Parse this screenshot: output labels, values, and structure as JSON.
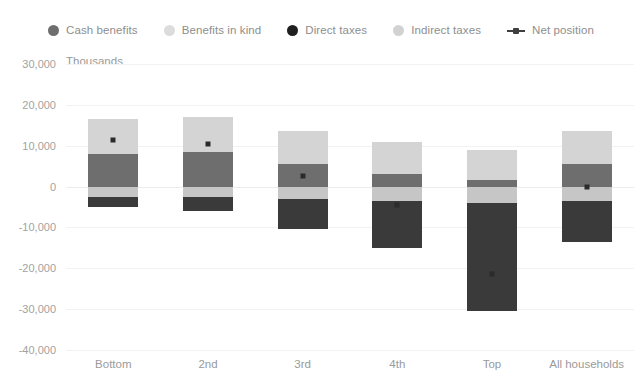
{
  "chart_data": {
    "type": "bar",
    "subtype": "stacked-bar-with-line",
    "title": "",
    "xlabel": "",
    "ylabel": "Thousands",
    "ylim": [
      -40000,
      30000
    ],
    "ytick_step": 10000,
    "grid": true,
    "legend_position": "top",
    "categories": [
      "Bottom",
      "2nd",
      "3rd",
      "4th",
      "Top",
      "All households"
    ],
    "ytick_labels": [
      "30,000",
      "20,000",
      "10,000",
      "0",
      "-10,000",
      "-20,000",
      "-30,000",
      "-40,000"
    ],
    "ytick_values": [
      30000,
      20000,
      10000,
      0,
      -10000,
      -20000,
      -30000,
      -40000
    ],
    "series": [
      {
        "name": "Cash benefits",
        "color": "#6e6e6e",
        "type": "bar",
        "values": [
          8000,
          8500,
          5500,
          3000,
          1500,
          5500
        ]
      },
      {
        "name": "Benefits in kind",
        "color": "#d4d4d4",
        "type": "bar",
        "values": [
          8500,
          8500,
          8000,
          8000,
          7500,
          8000
        ]
      },
      {
        "name": "Indirect taxes",
        "color": "#c6c6c6",
        "type": "bar",
        "values": [
          -2500,
          -2500,
          -3000,
          -3500,
          -4000,
          -3500
        ]
      },
      {
        "name": "Direct taxes",
        "color": "#3a3a3a",
        "type": "bar",
        "values": [
          -2500,
          -3500,
          -7500,
          -11500,
          -26500,
          -10000
        ]
      },
      {
        "name": "Net position",
        "color": "#2b2b2b",
        "type": "line",
        "values": [
          11500,
          10500,
          2500,
          -4500,
          -21500,
          0
        ]
      }
    ]
  },
  "legend": {
    "items": [
      {
        "label": "Cash benefits",
        "marker": "dot-icon",
        "color": "#6e6e6e"
      },
      {
        "label": "Benefits in kind",
        "marker": "dot-icon",
        "color": "#dcdcdc"
      },
      {
        "label": "Direct taxes",
        "marker": "dot-icon",
        "color": "#1f1f1f"
      },
      {
        "label": "Indirect taxes",
        "marker": "dot-icon",
        "color": "#d2d2d2"
      },
      {
        "label": "Net position",
        "marker": "line-marker-icon",
        "color": "#3f3f3f"
      }
    ]
  },
  "axis": {
    "y_title": "Thousands"
  }
}
